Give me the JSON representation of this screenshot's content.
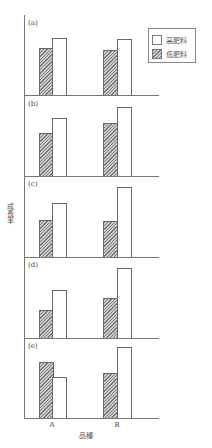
{
  "chart_data": {
    "type": "bar",
    "title": "",
    "xlabel": "品種",
    "ylabel": "成長率",
    "categories": [
      "A",
      "B"
    ],
    "legend": [
      {
        "name": "高肥料",
        "style": "white"
      },
      {
        "name": "低肥料",
        "style": "hatched"
      }
    ],
    "legend_position": "top-right",
    "grid": false,
    "y_units": "relative (no tick labels)",
    "panels": [
      {
        "label": "(a)",
        "series": [
          {
            "name": "低肥料",
            "values": [
              47,
              45
            ]
          },
          {
            "name": "高肥料",
            "values": [
              57,
              56
            ]
          }
        ]
      },
      {
        "label": "(b)",
        "series": [
          {
            "name": "低肥料",
            "values": [
              43,
              53
            ]
          },
          {
            "name": "高肥料",
            "values": [
              58,
              69
            ]
          }
        ]
      },
      {
        "label": "(c)",
        "series": [
          {
            "name": "低肥料",
            "values": [
              37,
              36
            ]
          },
          {
            "name": "高肥料",
            "values": [
              54,
              70
            ]
          }
        ]
      },
      {
        "label": "(d)",
        "series": [
          {
            "name": "低肥料",
            "values": [
              28,
              40
            ]
          },
          {
            "name": "高肥料",
            "values": [
              48,
              70
            ]
          }
        ]
      },
      {
        "label": "(e)",
        "series": [
          {
            "name": "低肥料",
            "values": [
              56,
              45
            ]
          },
          {
            "name": "高肥料",
            "values": [
              41,
              71
            ]
          }
        ]
      }
    ]
  },
  "legend": {
    "high_label": "高肥料",
    "low_label": "低肥料"
  },
  "axis": {
    "ylabel": "成長率",
    "xlabel": "品種",
    "tick_a": "A",
    "tick_b": "B"
  },
  "colors": {
    "axis": "#777777",
    "bar_border": "#666666",
    "hatch_dark": "#7a7a7a",
    "hatch_light": "#cfcfcf"
  }
}
